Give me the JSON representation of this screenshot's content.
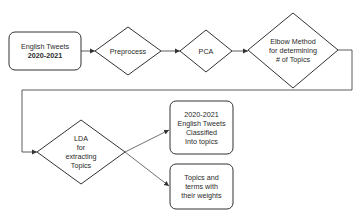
{
  "diagram": {
    "type": "flowchart",
    "nodes": [
      {
        "id": "input",
        "shape": "rounded-rect",
        "lines": [
          "English Tweets",
          "2020-2021"
        ]
      },
      {
        "id": "preprocess",
        "shape": "diamond",
        "lines": [
          "Preprocess"
        ]
      },
      {
        "id": "pca",
        "shape": "diamond",
        "lines": [
          "PCA"
        ]
      },
      {
        "id": "elbow",
        "shape": "diamond",
        "lines": [
          "Elbow Method",
          "for determining",
          "# of Topics"
        ]
      },
      {
        "id": "lda",
        "shape": "diamond",
        "lines": [
          "LDA",
          "for",
          "extracting",
          "Topics"
        ]
      },
      {
        "id": "classified",
        "shape": "rounded-rect",
        "lines": [
          "2020-2021",
          "English Tweets",
          "Classified",
          "Into topics"
        ]
      },
      {
        "id": "topics",
        "shape": "rounded-rect",
        "lines": [
          "Topics and",
          "terms with",
          "their weights"
        ]
      }
    ],
    "edges": [
      {
        "from": "input",
        "to": "preprocess"
      },
      {
        "from": "preprocess",
        "to": "pca"
      },
      {
        "from": "pca",
        "to": "elbow"
      },
      {
        "from": "elbow",
        "to": "lda"
      },
      {
        "from": "lda",
        "to": "classified"
      },
      {
        "from": "lda",
        "to": "topics"
      }
    ],
    "colors": {
      "stroke": "#333333",
      "background": "#ffffff",
      "text": "#2a2a2a"
    }
  }
}
